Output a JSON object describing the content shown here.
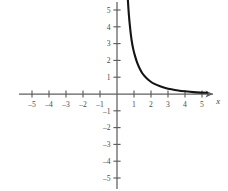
{
  "chart_data": {
    "type": "line",
    "title": "",
    "subtitle": "",
    "xlabel": "x",
    "ylabel": "",
    "xlim": [
      -5.7,
      5.9
    ],
    "ylim": [
      -5.6,
      5.6
    ],
    "grid": false,
    "legend": null,
    "x_ticks": [
      -5,
      -4,
      -3,
      -2,
      -1,
      1,
      2,
      3,
      4,
      5
    ],
    "y_ticks": [
      -5,
      -4,
      -3,
      -2,
      -1,
      1,
      2,
      3,
      4,
      5
    ],
    "x_tick_labels": [
      "–5",
      "–4",
      "–3",
      "–2",
      "–1",
      "1",
      "2",
      "3",
      "4",
      "5"
    ],
    "y_tick_labels": [
      "–5",
      "–4",
      "–3",
      "–2",
      "–1",
      "1",
      "2",
      "3",
      "4",
      "5"
    ],
    "axis_arrow_right": true,
    "series": [
      {
        "name": "decreasing-reciprocal-curve",
        "color": "#141414",
        "x": [
          0.64,
          0.7,
          0.78,
          0.86,
          0.95,
          1.05,
          1.18,
          1.32,
          1.5,
          1.7,
          1.95,
          2.2,
          2.5,
          2.85,
          3.2,
          3.6,
          4.0,
          4.5,
          5.0,
          5.3
        ],
        "y": [
          5.6,
          4.7,
          3.85,
          3.2,
          2.7,
          2.3,
          1.88,
          1.55,
          1.22,
          0.98,
          0.76,
          0.6,
          0.47,
          0.36,
          0.28,
          0.21,
          0.16,
          0.11,
          0.08,
          0.07
        ]
      }
    ]
  },
  "axis": {
    "x_label": "x",
    "origin_label": ""
  },
  "colors": {
    "background": "#ffffff",
    "axis": "#5f5f61",
    "curve": "#141414",
    "tick_text": "#4a4a4c"
  }
}
